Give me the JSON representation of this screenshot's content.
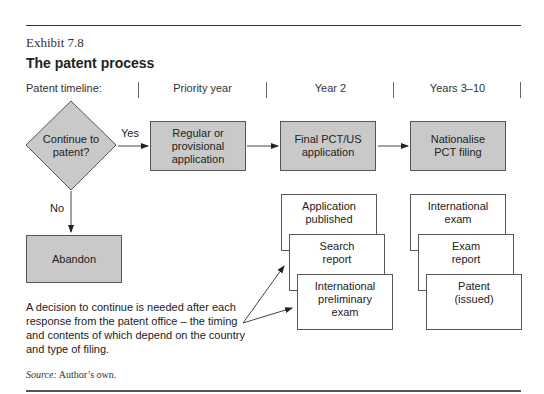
{
  "exhibit": {
    "label": "Exhibit 7.8",
    "title": "The patent process"
  },
  "timeline": {
    "label": "Patent timeline:",
    "columns": [
      "Priority year",
      "Year 2",
      "Years 3–10"
    ]
  },
  "flow": {
    "decision": "Continue to patent?",
    "decision_line1": "Continue to",
    "decision_line2": "patent?",
    "yes_label": "Yes",
    "no_label": "No",
    "abandon": "Abandon",
    "main_steps": [
      {
        "lines": [
          "Regular or",
          "provisional",
          "application"
        ]
      },
      {
        "lines": [
          "Final PCT/US",
          "application"
        ]
      },
      {
        "lines": [
          "Nationalise",
          "PCT filing"
        ]
      }
    ],
    "year2_stack": [
      {
        "lines": [
          "Application",
          "published"
        ]
      },
      {
        "lines": [
          "Search",
          "report"
        ]
      },
      {
        "lines": [
          "International",
          "preliminary",
          "exam"
        ]
      }
    ],
    "years3_10_stack": [
      {
        "lines": [
          "International",
          "exam"
        ]
      },
      {
        "lines": [
          "Exam",
          "report"
        ]
      },
      {
        "lines": [
          "Patent",
          "(issued)"
        ]
      }
    ]
  },
  "note": {
    "lines": [
      "A decision to continue is needed after each",
      "response from the patent office – the timing",
      "and contents of which depend on the country",
      "and type of filing."
    ]
  },
  "source": {
    "label": "Source:",
    "text": "Author’s own."
  },
  "colors": {
    "box_fill": "#c9c9c9",
    "stroke": "#555555"
  }
}
